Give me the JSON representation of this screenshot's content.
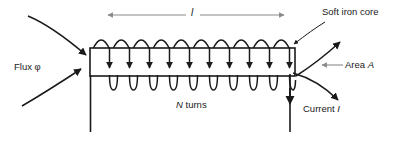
{
  "figure": {
    "labels": {
      "length": "l",
      "flux": "Flux φ",
      "soft_iron_core": "Soft iron core",
      "area": "Area A",
      "area_symbol": "A",
      "area_prefix": "Area ",
      "n_turns": "N turns",
      "n_symbol": "N",
      "turns_word": " turns",
      "current": "Current I",
      "current_prefix": "Current ",
      "current_symbol": "I"
    },
    "colors": {
      "stroke": "#1a1a1a",
      "dimension_arrow": "#8a8a8a",
      "background": "#ffffff",
      "text": "#1a1a1a"
    },
    "geometry": {
      "core_x": 90,
      "core_y": 48,
      "core_width": 205,
      "core_height": 28,
      "coil_turns": 10
    }
  }
}
